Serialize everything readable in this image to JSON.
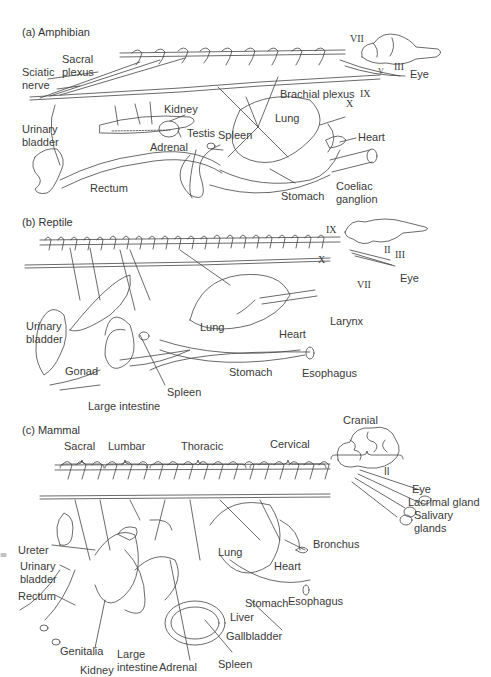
{
  "panels": [
    {
      "title": "(a) Amphibian",
      "labels": {
        "sacral_plexus_1": "Sacral",
        "sacral_plexus_2": "plexus",
        "sciatic_nerve_1": "Sciatic",
        "sciatic_nerve_2": "nerve",
        "kidney": "Kidney",
        "urinary_bladder_1": "Urinary",
        "urinary_bladder_2": "bladder",
        "testis": "Testis",
        "spleen": "Spleen",
        "adrenal": "Adrenal",
        "rectum": "Rectum",
        "brachial_plexus": "Brachial plexus",
        "lung": "Lung",
        "heart": "Heart",
        "stomach": "Stomach",
        "coeliac_ganglion_1": "Coeliac",
        "coeliac_ganglion_2": "ganglion",
        "eye": "Eye",
        "nerve_vii": "VII",
        "nerve_iii": "III",
        "nerve_v": "V",
        "nerve_ix": "IX",
        "nerve_x": "X"
      }
    },
    {
      "title": "(b) Reptile",
      "labels": {
        "urinary_bladder_1": "Urinary",
        "urinary_bladder_2": "bladder",
        "gonad": "Gonad",
        "spleen": "Spleen",
        "large_intestine": "Large intestine",
        "lung": "Lung",
        "stomach": "Stomach",
        "heart": "Heart",
        "esophagus": "Esophagus",
        "larynx": "Larynx",
        "eye": "Eye",
        "nerve_ix": "IX",
        "nerve_x": "X",
        "nerve_ii": "II",
        "nerve_iii": "III",
        "nerve_vii": "VII"
      }
    },
    {
      "title": "(c) Mammal",
      "regions": [
        "Sacral",
        "Lumbar",
        "Thoracic",
        "Cervical",
        "Cranial"
      ],
      "labels": {
        "ureter": "Ureter",
        "urinary_bladder_1": "Urinary",
        "urinary_bladder_2": "bladder",
        "rectum": "Rectum",
        "genitalia": "Genitalia",
        "kidney": "Kidney",
        "large_intestine_1": "Large",
        "large_intestine_2": "intestine",
        "adrenal": "Adrenal",
        "spleen": "Spleen",
        "gallbladder": "Gallbladder",
        "liver": "Liver",
        "stomach": "Stomach",
        "lung": "Lung",
        "heart": "Heart",
        "esophagus": "Esophagus",
        "bronchus": "Bronchus",
        "eye": "Eye",
        "lacrimal_gland": "Lacrimal gland",
        "salivary_glands_1": "Salivary",
        "salivary_glands_2": "glands",
        "nerve_ii": "II"
      }
    }
  ]
}
